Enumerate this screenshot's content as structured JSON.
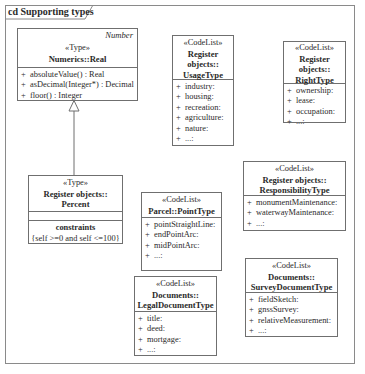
{
  "frame": {
    "title": "cd Supporting types"
  },
  "classes": {
    "real": {
      "abstract_tag": "Number",
      "stereotype": "«Type»",
      "name": "Numerics::Real",
      "operations": [
        {
          "vis": "+",
          "text": "absoluteValue() : Real"
        },
        {
          "vis": "+",
          "text": "asDecimal(Integer*) : Decimal"
        },
        {
          "vis": "+",
          "text": "floor() : Integer"
        }
      ]
    },
    "usage": {
      "stereotype": "«CodeList»",
      "name_lines": [
        "Register",
        "objects::",
        "UsageType"
      ],
      "values": [
        {
          "vis": "+",
          "text": "industry:"
        },
        {
          "vis": "+",
          "text": "housing:"
        },
        {
          "vis": "+",
          "text": "recreation:"
        },
        {
          "vis": "+",
          "text": "agriculture:"
        },
        {
          "vis": "+",
          "text": "nature:"
        },
        {
          "vis": "+",
          "text": "...:"
        }
      ]
    },
    "right": {
      "stereotype": "«CodeList»",
      "name_lines": [
        "Register",
        "objects::",
        "RightType"
      ],
      "values": [
        {
          "vis": "+",
          "text": "ownership:"
        },
        {
          "vis": "+",
          "text": "lease:"
        },
        {
          "vis": "+",
          "text": "occupation:"
        },
        {
          "vis": "+",
          "text": "...:"
        }
      ]
    },
    "percent": {
      "stereotype": "«Type»",
      "name_lines": [
        "Register objects::",
        "Percent"
      ],
      "constraints_title": "constraints",
      "constraint": "{self >=0 and self <=100}"
    },
    "point": {
      "stereotype": "«CodeList»",
      "name_lines": [
        "Parcel::PointType"
      ],
      "values": [
        {
          "vis": "+",
          "text": "pointStraightLine:"
        },
        {
          "vis": "+",
          "text": "endPointArc:"
        },
        {
          "vis": "+",
          "text": "midPointArc:"
        },
        {
          "vis": "+",
          "text": "...:"
        }
      ]
    },
    "responsibility": {
      "stereotype": "«CodeList»",
      "name_lines": [
        "Register objects::",
        "ResponsibilityType"
      ],
      "values": [
        {
          "vis": "+",
          "text": "monumentMaintenance:"
        },
        {
          "vis": "+",
          "text": "waterwayMaintenance:"
        },
        {
          "vis": "+",
          "text": "...:"
        }
      ]
    },
    "legal": {
      "stereotype": "«CodeList»",
      "name_lines": [
        "Documents::",
        "LegalDocumentType"
      ],
      "values": [
        {
          "vis": "+",
          "text": "title:"
        },
        {
          "vis": "+",
          "text": "deed:"
        },
        {
          "vis": "+",
          "text": "mortgage:"
        },
        {
          "vis": "+",
          "text": "...:"
        }
      ]
    },
    "survey": {
      "stereotype": "«CodeList»",
      "name_lines": [
        "Documents::",
        "SurveyDocumentType"
      ],
      "values": [
        {
          "vis": "+",
          "text": "fieldSketch:"
        },
        {
          "vis": "+",
          "text": "gnssSurvey:"
        },
        {
          "vis": "+",
          "text": "relativeMeasurement:"
        },
        {
          "vis": "+",
          "text": "...:"
        }
      ]
    }
  },
  "relations": [
    {
      "type": "generalization",
      "from": "Register objects::Percent",
      "to": "Numerics::Real"
    }
  ]
}
